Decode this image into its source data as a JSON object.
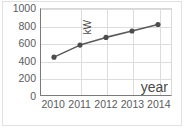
{
  "chart_data": {
    "type": "line",
    "title": "",
    "subtitle": "",
    "xlabel": "year",
    "ylabel": "kW",
    "categories": [
      "2010",
      "2011",
      "2012",
      "2013",
      "2014"
    ],
    "x": [
      2010,
      2011,
      2012,
      2013,
      2014
    ],
    "values": [
      440,
      580,
      670,
      745,
      820
    ],
    "series": [
      {
        "name": "kW",
        "values": [
          440,
          580,
          670,
          745,
          820
        ],
        "color": "#5a5a5a",
        "marker": "circle",
        "marker_color": "#4d4d4d"
      }
    ],
    "ylim": [
      0,
      1000
    ],
    "yticks": [
      0,
      200,
      400,
      600,
      800,
      1000
    ],
    "ytick_labels": [
      "0",
      "200",
      "400",
      "600",
      "800",
      "1000"
    ],
    "xtick_labels": [
      "2010",
      "2011",
      "2012",
      "2013",
      "2014"
    ],
    "grid": true,
    "grid_color": "#dcdcdc",
    "legend": false,
    "legend_position": "none",
    "axis_color": "#7a7a7a",
    "tick_label_color": "#5b5b5b",
    "background": "#ffffff",
    "annotations": []
  },
  "figure": {
    "width": 186,
    "height": 138,
    "border_color": "#e2e2e2"
  }
}
